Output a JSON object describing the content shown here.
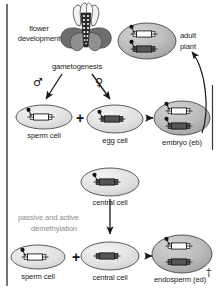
{
  "figure": {
    "frame_color": "#3a3a3a",
    "background": "#ffffff"
  },
  "labels": {
    "flower_development_line1": "flower",
    "flower_development_line2": "development",
    "gametogenesis": "gametogenesis",
    "male_symbol": "♂",
    "female_symbol": "♀",
    "adult_plant_line1": "adult",
    "adult_plant_line2": "plant",
    "sperm_cell_top": "sperm cell",
    "egg_cell": "egg cell",
    "embryo": "embryo (eb)",
    "central_cell_top": "central cell",
    "demethylation_line1": "passive and active",
    "demethylation_line2": "demethylation",
    "sperm_cell_bottom": "sperm cell",
    "central_cell_bottom": "central cell",
    "endosperm": "endosperm (ed)",
    "plus_sign": "+",
    "dagger": "†"
  },
  "colors": {
    "cell_fill_light": "#e3e3e3",
    "cell_fill_dark": "#b8b8b8",
    "cell_stroke": "#4a4a4a",
    "gene_unmethylated": "#fdfdfd",
    "gene_methylated": "#555555",
    "gene_stroke": "#1c1c1c",
    "methyl_dot": "#111111",
    "arrow": "#1a1a1a",
    "gray_text": "#8d8d8d",
    "text": "#1a1a1a"
  },
  "cells": [
    {
      "name": "adult-plant",
      "label": "adult plant",
      "cx": 147,
      "cy": 41,
      "rx": 29,
      "ry": 18,
      "fill": "dark",
      "genes": [
        {
          "state": "unmethylated",
          "methylated_dot": true,
          "x": 147,
          "y": 34
        },
        {
          "state": "methylated",
          "methylated_dot": true,
          "x": 147,
          "y": 49
        }
      ]
    },
    {
      "name": "sperm-cell-top",
      "label": "sperm cell",
      "cx": 44,
      "cy": 117,
      "rx": 28,
      "ry": 12,
      "fill": "light",
      "genes": [
        {
          "state": "unmethylated",
          "methylated_dot": true,
          "x": 44,
          "y": 117
        }
      ]
    },
    {
      "name": "egg-cell",
      "label": "egg cell",
      "cx": 115,
      "cy": 119,
      "rx": 28,
      "ry": 14,
      "fill": "light",
      "genes": [
        {
          "state": "methylated",
          "methylated_dot": true,
          "x": 115,
          "y": 119
        }
      ]
    },
    {
      "name": "embryo",
      "label": "embryo (eb)",
      "cx": 182,
      "cy": 118,
      "rx": 28,
      "ry": 17,
      "fill": "dark",
      "genes": [
        {
          "state": "unmethylated",
          "methylated_dot": true,
          "x": 182,
          "y": 111
        },
        {
          "state": "methylated",
          "methylated_dot": true,
          "x": 182,
          "y": 126
        }
      ]
    },
    {
      "name": "central-cell-top",
      "label": "central cell",
      "cx": 110,
      "cy": 182,
      "rx": 29,
      "ry": 14,
      "fill": "light",
      "genes": [
        {
          "state": "methylated",
          "methylated_dot": true,
          "x": 110,
          "y": 182
        }
      ]
    },
    {
      "name": "sperm-cell-bottom",
      "label": "sperm cell",
      "cx": 38,
      "cy": 257,
      "rx": 27,
      "ry": 12,
      "fill": "light",
      "genes": [
        {
          "state": "unmethylated",
          "methylated_dot": true,
          "x": 38,
          "y": 257
        }
      ]
    },
    {
      "name": "central-cell-bottom",
      "label": "central cell",
      "cx": 110,
      "cy": 256,
      "rx": 29,
      "ry": 14,
      "fill": "light",
      "genes": [
        {
          "state": "methylated",
          "methylated_dot": false,
          "x": 110,
          "y": 256
        }
      ]
    },
    {
      "name": "endosperm",
      "label": "endosperm (ed)",
      "cx": 182,
      "cy": 254,
      "rx": 30,
      "ry": 19,
      "fill": "dark",
      "genes": [
        {
          "state": "unmethylated",
          "methylated_dot": true,
          "x": 182,
          "y": 246
        },
        {
          "state": "methylated",
          "methylated_dot": false,
          "x": 182,
          "y": 262
        }
      ]
    }
  ],
  "arrows": [
    {
      "name": "male-gametogenesis-arrow",
      "from": [
        62,
        74
      ],
      "to": [
        44,
        100
      ]
    },
    {
      "name": "female-gametogenesis-arrow",
      "from": [
        92,
        74
      ],
      "to": [
        112,
        100
      ]
    },
    {
      "name": "fertilization-embryo-arrow",
      "from": [
        147,
        118
      ],
      "to": [
        160,
        118
      ]
    },
    {
      "name": "embryo-to-adult-arrow",
      "from": [
        200,
        135
      ],
      "to": [
        190,
        48
      ]
    },
    {
      "name": "demethylation-arrow",
      "from": [
        110,
        200
      ],
      "to": [
        110,
        236
      ]
    },
    {
      "name": "fertilization-endosperm-arrow",
      "from": [
        146,
        256
      ],
      "to": [
        158,
        256
      ]
    }
  ]
}
